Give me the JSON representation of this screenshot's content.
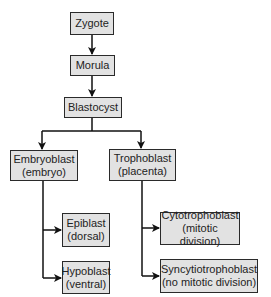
{
  "title": "",
  "nodes": {
    "zygote": {
      "label": "Zygote"
    },
    "morula": {
      "label": "Morula"
    },
    "blastocyst": {
      "label": "Blastocyst"
    },
    "embryoblast": {
      "label": "Embryoblast",
      "sub": "(embryo)"
    },
    "trophoblast": {
      "label": "Trophoblast",
      "sub": "(placenta)"
    },
    "epiblast": {
      "label": "Epiblast",
      "sub": "(dorsal)"
    },
    "hypoblast": {
      "label": "Hypoblast",
      "sub": "(ventral)"
    },
    "cytotrophoblast": {
      "label": "Cytotrophoblast",
      "sub": "(mitotic division)"
    },
    "syncytiotrophoblast": {
      "label": "Syncytiotrophoblast",
      "sub": "(no mitotic division)"
    }
  },
  "edges": [
    [
      "zygote",
      "morula"
    ],
    [
      "morula",
      "blastocyst"
    ],
    [
      "blastocyst",
      "embryoblast"
    ],
    [
      "blastocyst",
      "trophoblast"
    ],
    [
      "embryoblast",
      "epiblast"
    ],
    [
      "embryoblast",
      "hypoblast"
    ],
    [
      "trophoblast",
      "cytotrophoblast"
    ],
    [
      "trophoblast",
      "syncytiotrophoblast"
    ]
  ],
  "colors": {
    "box_fill": "#e2e2e2",
    "box_border": "#2a2a2a",
    "line": "#111111"
  }
}
